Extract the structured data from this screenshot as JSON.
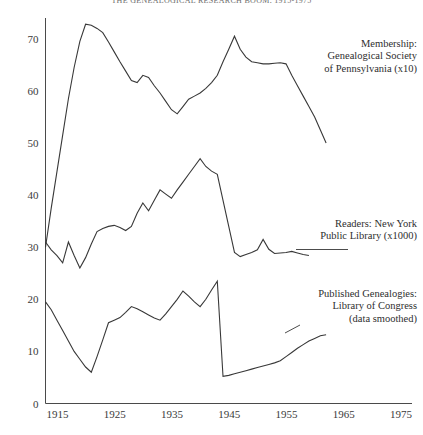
{
  "figure": {
    "title": "THE GENEALOGICAL RESEARCH BOOM, 1915-1975"
  },
  "annotations": {
    "membership": [
      "Membership:",
      "Genealogical Society",
      "of Pennsylvania (x10)"
    ],
    "readers": [
      "Readers: New York",
      "Public Library (x1000)"
    ],
    "genealogies": [
      "Published Genealogies:",
      "Library of Congress",
      "(data smoothed)"
    ]
  },
  "chart_data": {
    "type": "line",
    "title": "THE GENEALOGICAL RESEARCH BOOM, 1915-1975",
    "xlabel": "",
    "ylabel": "",
    "xlim": [
      1915,
      1979
    ],
    "ylim": [
      0,
      74
    ],
    "grid": false,
    "legend_position": "inline-right-annotations",
    "xticks": [
      1915,
      1925,
      1935,
      1945,
      1955,
      1965,
      1975
    ],
    "yticks": [
      0,
      10,
      20,
      30,
      40,
      50,
      60,
      70
    ],
    "series": [
      {
        "name": "Membership: Genealogical Society of Pennsylvania (x10)",
        "x": [
          1915,
          1916,
          1917,
          1918,
          1919,
          1920,
          1921,
          1922,
          1923,
          1924,
          1925,
          1926,
          1927,
          1928,
          1929,
          1930,
          1931,
          1932,
          1933,
          1934,
          1935,
          1936,
          1937,
          1938,
          1939,
          1940,
          1941,
          1942,
          1943,
          1944,
          1945,
          1946,
          1947,
          1948,
          1949,
          1950,
          1951,
          1952,
          1953,
          1954,
          1955,
          1956,
          1957,
          1958,
          1959,
          1960,
          1961,
          1962,
          1963,
          1964
        ],
        "y": [
          30.0,
          37.5,
          44.5,
          51.5,
          58.5,
          64.5,
          69.5,
          72.8,
          72.6,
          72.0,
          71.2,
          69.4,
          67.5,
          65.6,
          63.8,
          62.0,
          61.6,
          63.0,
          62.6,
          61.0,
          59.6,
          58.0,
          56.4,
          55.6,
          57.0,
          58.4,
          59.0,
          59.6,
          60.5,
          61.6,
          63.0,
          65.6,
          68.0,
          70.5,
          68.0,
          66.5,
          65.6,
          65.4,
          65.2,
          65.2,
          65.3,
          65.4,
          65.2,
          63.0,
          61.0,
          59.0,
          57.0,
          55.0,
          52.5,
          50.0
        ]
      },
      {
        "name": "Readers: New York Public Library (x1000)",
        "x": [
          1915,
          1916,
          1917,
          1918,
          1919,
          1920,
          1921,
          1922,
          1923,
          1924,
          1925,
          1926,
          1927,
          1928,
          1929,
          1930,
          1931,
          1932,
          1933,
          1934,
          1935,
          1936,
          1937,
          1938,
          1939,
          1940,
          1941,
          1942,
          1943,
          1944,
          1945,
          1946,
          1947,
          1948,
          1949,
          1950,
          1951,
          1952,
          1953,
          1954,
          1955,
          1956,
          1957,
          1958,
          1959,
          1960,
          1961
        ],
        "y": [
          31.0,
          29.5,
          28.4,
          27.0,
          31.0,
          28.4,
          26.0,
          28.0,
          30.6,
          33.0,
          33.6,
          34.0,
          34.2,
          33.8,
          33.2,
          34.0,
          36.5,
          38.5,
          37.0,
          39.0,
          41.0,
          40.2,
          39.4,
          41.0,
          42.5,
          44.0,
          45.5,
          47.0,
          45.5,
          44.6,
          44.0,
          39.0,
          34.0,
          29.0,
          28.2,
          28.6,
          29.0,
          29.5,
          31.5,
          29.6,
          28.8,
          28.9,
          29.0,
          29.2,
          28.9,
          28.6,
          28.4
        ]
      },
      {
        "name": "Published Genealogies: Library of Congress (data smoothed)",
        "x": [
          1915,
          1916,
          1917,
          1918,
          1919,
          1920,
          1921,
          1922,
          1923,
          1924,
          1925,
          1926,
          1927,
          1928,
          1929,
          1930,
          1931,
          1932,
          1933,
          1934,
          1935,
          1936,
          1937,
          1938,
          1939,
          1940,
          1941,
          1942,
          1943,
          1944,
          1945,
          1946,
          1947,
          1948,
          1949,
          1950,
          1951,
          1952,
          1953,
          1954,
          1955,
          1956,
          1957,
          1958,
          1959,
          1960,
          1961,
          1962,
          1963,
          1964
        ],
        "y": [
          19.5,
          18.0,
          16.0,
          14.0,
          12.0,
          10.0,
          8.5,
          7.0,
          6.0,
          9.0,
          12.2,
          15.5,
          16.0,
          16.5,
          17.5,
          18.6,
          18.2,
          17.6,
          17.0,
          16.4,
          16.0,
          17.2,
          18.6,
          20.0,
          21.6,
          20.6,
          19.5,
          18.6,
          20.0,
          21.8,
          23.5,
          5.2,
          5.4,
          5.7,
          6.0,
          6.3,
          6.6,
          6.9,
          7.2,
          7.5,
          7.8,
          8.2,
          9.0,
          9.8,
          10.6,
          11.3,
          12.0,
          12.5,
          13.0,
          13.2
        ]
      }
    ]
  }
}
